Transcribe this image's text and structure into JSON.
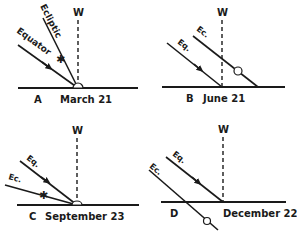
{
  "panels": [
    {
      "id": "A",
      "letter": "A",
      "date": "March 21",
      "zenith_label": "W",
      "equator_label": "Equator",
      "ecliptic_label": "Ecliptic",
      "sun_marker": "star",
      "sun_position": "on horizon at W"
    },
    {
      "id": "B",
      "letter": "B",
      "date": "June 21",
      "zenith_label": "W",
      "equator_label": "Eq.",
      "ecliptic_label": "Ec.",
      "sun_marker": "circle",
      "sun_position": "above horizon"
    },
    {
      "id": "C",
      "letter": "C",
      "date": "September 23",
      "zenith_label": "W",
      "equator_label": "Eq.",
      "ecliptic_label": "Ec.",
      "sun_marker": "star",
      "sun_position": "on horizon at W"
    },
    {
      "id": "D",
      "letter": "D",
      "date": "December 22",
      "zenith_label": "W",
      "equator_label": "Eq.",
      "ecliptic_label": "Ec.",
      "sun_marker": "circle",
      "sun_position": "below horizon"
    }
  ],
  "colors": {
    "ink": "#1a1a1a",
    "background": "#ffffff"
  }
}
